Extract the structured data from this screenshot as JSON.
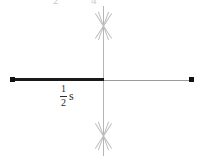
{
  "figure": {
    "background_color": "#ffffff",
    "width": 202,
    "height": 160
  },
  "axes": {
    "vertical_axis": {
      "name": "vertical-axis",
      "color": "#b4b4b4"
    },
    "horizontal_axis_right": {
      "name": "horizontal-axis-right",
      "color": "#9a9a9a"
    }
  },
  "segment": {
    "name": "bold-measured-segment",
    "color": "#1a1a1a",
    "label": {
      "numerator": "1",
      "denominator": "2",
      "unit": "s",
      "full_text": "1/2 s"
    }
  },
  "endpoints": [
    {
      "name": "left-endpoint-dot",
      "color": "#111111"
    },
    {
      "name": "right-endpoint-dot",
      "color": "#111111"
    }
  ],
  "tick_marks": [
    {
      "name": "x-cross-mark-top",
      "color": "#bdbdbd"
    },
    {
      "name": "x-cross-mark-bottom",
      "color": "#bdbdbd"
    }
  ],
  "clipped_top_labels": [
    {
      "text": "2"
    },
    {
      "text": "4"
    }
  ]
}
